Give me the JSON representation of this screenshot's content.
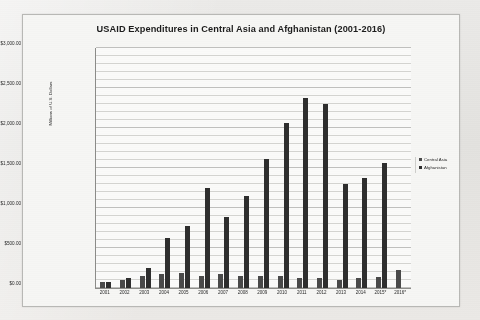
{
  "chart_data": {
    "type": "bar",
    "title": "USAID Expenditures in Central Asia and Afghanistan (2001-2016)",
    "xlabel": "",
    "ylabel": "Millions of U.S. Dollars",
    "ylim": [
      0,
      3000
    ],
    "ytick_labels": [
      "$3,000.00",
      "$2,500.00",
      "$2,000.00",
      "$1,500.00",
      "$1,000.00",
      "$500.00",
      "$0.00"
    ],
    "ytick_values": [
      3000,
      2500,
      2000,
      1500,
      1000,
      500,
      0
    ],
    "ytick_step": 500,
    "minor_gridline_step": 100,
    "grid": true,
    "legend_position": "right",
    "categories": [
      "2001",
      "2002",
      "2003",
      "2004",
      "2005",
      "2006",
      "2007",
      "2008",
      "2009",
      "2010",
      "2011",
      "2012",
      "2013",
      "2014",
      "2015*",
      "2016*"
    ],
    "series": [
      {
        "name": "Central Asia",
        "color": "#4a4a4a",
        "values": [
          70,
          100,
          150,
          175,
          185,
          150,
          180,
          155,
          150,
          150,
          120,
          130,
          100,
          120,
          135,
          230
        ]
      },
      {
        "name": "Afghanistan",
        "color": "#2e2e2e",
        "values": [
          75,
          125,
          250,
          620,
          780,
          1250,
          890,
          1150,
          1610,
          2060,
          2380,
          2300,
          1300,
          1380,
          1560,
          0
        ]
      }
    ],
    "annotations": [
      "Source: U.S. Agency for International Development",
      "*The selected year is not yet fully reported."
    ]
  },
  "legend": {
    "items": [
      {
        "label": "Central Asia"
      },
      {
        "label": "Afghanistan"
      }
    ]
  }
}
